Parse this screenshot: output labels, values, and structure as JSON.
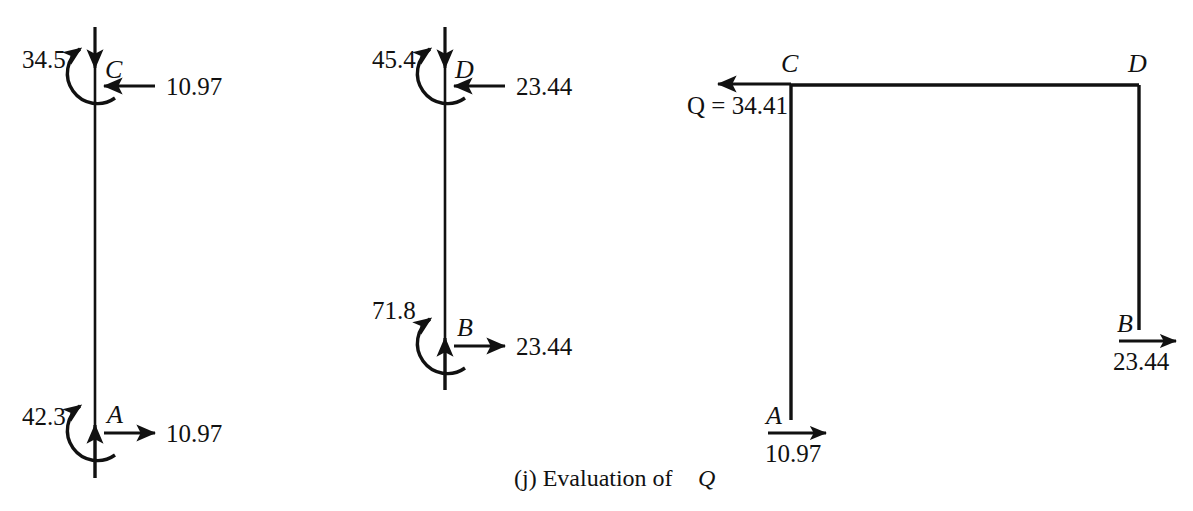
{
  "figure": {
    "caption_prefix": "(j) Evaluation of",
    "caption_symbol": "Q",
    "background_color": "#ffffff",
    "ink_color": "#111111"
  },
  "free_body_left": {
    "name": "column-free-body-CA",
    "top_joint": {
      "label": "C",
      "axial_force": "34.5",
      "shear_force": "10.97",
      "axial_arrow_direction": "down",
      "shear_arrow_direction": "left",
      "moment_direction": "counterclockwise"
    },
    "bottom_joint": {
      "label": "A",
      "axial_force": "42.3",
      "shear_force": "10.97",
      "axial_arrow_direction": "up",
      "shear_arrow_direction": "right",
      "moment_direction": "counterclockwise"
    }
  },
  "free_body_middle": {
    "name": "column-free-body-DB",
    "top_joint": {
      "label": "D",
      "axial_force": "45.4",
      "shear_force": "23.44",
      "axial_arrow_direction": "down",
      "shear_arrow_direction": "left",
      "moment_direction": "counterclockwise"
    },
    "bottom_joint": {
      "label": "B",
      "axial_force": "71.8",
      "shear_force": "23.44",
      "axial_arrow_direction": "up",
      "shear_arrow_direction": "right",
      "moment_direction": "counterclockwise"
    }
  },
  "frame_right": {
    "name": "frame-free-body",
    "joints": {
      "top_left": "C",
      "top_right": "D",
      "bottom_right": "B",
      "bottom_left": "A"
    },
    "applied_load": {
      "symbol": "Q",
      "equals": "=",
      "value": "34.41",
      "full_text": "Q = 34.41",
      "arrow_direction": "left"
    },
    "base_shear_left": {
      "joint": "A",
      "value": "10.97",
      "arrow_direction": "right"
    },
    "base_shear_right": {
      "joint": "B",
      "value": "23.44",
      "arrow_direction": "right"
    }
  }
}
